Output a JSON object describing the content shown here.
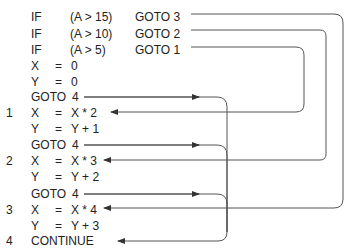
{
  "code": {
    "lines": [
      {
        "label": "",
        "c1": "IF",
        "c2": "(A > 15)",
        "c3": "GOTO 3"
      },
      {
        "label": "",
        "c1": "IF",
        "c2": "(A > 10)",
        "c3": "GOTO 2"
      },
      {
        "label": "",
        "c1": "IF",
        "c2": "(A > 5)",
        "c3": "GOTO 1"
      },
      {
        "label": "",
        "c1": "X",
        "c2": "=",
        "c3": "0"
      },
      {
        "label": "",
        "c1": "Y",
        "c2": "=",
        "c3": "0"
      },
      {
        "label": "",
        "c1": "GOTO",
        "c2": "",
        "c3": "4"
      },
      {
        "label": "1",
        "c1": "X",
        "c2": "=",
        "c3": "X * 2"
      },
      {
        "label": "",
        "c1": "Y",
        "c2": "=",
        "c3": "Y + 1"
      },
      {
        "label": "",
        "c1": "GOTO",
        "c2": "",
        "c3": "4"
      },
      {
        "label": "2",
        "c1": "X",
        "c2": "=",
        "c3": "X * 3"
      },
      {
        "label": "",
        "c1": "Y",
        "c2": "=",
        "c3": "Y + 2"
      },
      {
        "label": "",
        "c1": "GOTO",
        "c2": "",
        "c3": "4"
      },
      {
        "label": "3",
        "c1": "X",
        "c2": "=",
        "c3": "X * 4"
      },
      {
        "label": "",
        "c1": "Y",
        "c2": "=",
        "c3": "Y + 3"
      },
      {
        "label": "4",
        "c1": "CONTINUE",
        "c2": "",
        "c3": ""
      }
    ]
  },
  "colors": {
    "text": "#222222",
    "line": "#444444",
    "background": "#ffffff"
  }
}
